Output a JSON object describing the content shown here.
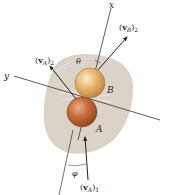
{
  "figure": {
    "background_color": "#ffffff",
    "surface_color": "#dcd3c8",
    "line_color": "#333333",
    "labels": {
      "x_axis": "x",
      "y_axis": "y",
      "theta": "θ",
      "phi": "φ",
      "ball_b": "B",
      "ball_a": "A",
      "vB2": {
        "paren_open": "(",
        "vec": "v",
        "sub": "B",
        "paren_close": ")",
        "index": "2"
      },
      "vA2": {
        "paren_open": "(",
        "vec": "v",
        "sub": "A",
        "paren_close": ")",
        "index": "2"
      },
      "vA1": {
        "paren_open": "(",
        "vec": "v",
        "sub": "A",
        "paren_close": ")",
        "index": "1"
      }
    },
    "balls": [
      {
        "name": "B",
        "color": "#e6b46c",
        "highlight": "#f8e3bc",
        "edge": "#9a6a30"
      },
      {
        "name": "A",
        "color": "#c7693a",
        "highlight": "#e8a67a",
        "edge": "#7a3a18"
      }
    ]
  }
}
